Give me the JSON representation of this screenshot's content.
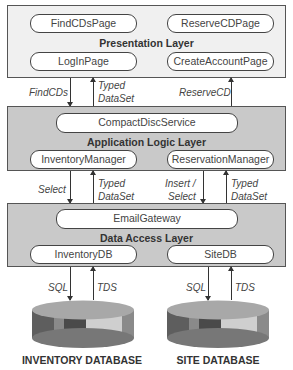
{
  "presentation_layer": {
    "label": "Presentation Layer",
    "nodes": [
      "FindCDsPage",
      "ReserveCDPage",
      "LogInPage",
      "CreateAccountPage"
    ]
  },
  "application_layer": {
    "label": "Application Logic Layer",
    "nodes": [
      "CompactDiscService",
      "InventoryManager",
      "ReservationManager"
    ]
  },
  "data_layer": {
    "label": "Data Access Layer",
    "nodes": [
      "EmailGateway",
      "InventoryDB",
      "SiteDB"
    ]
  },
  "connections": {
    "pres_to_app": {
      "left_down": "FindCDs",
      "left_up_1": "Typed",
      "left_up_2": "DataSet",
      "right_up": "ReserveCD"
    },
    "app_to_data": {
      "left_down": "Select",
      "left_up_1": "Typed",
      "left_up_2": "DataSet",
      "right_down_1": "Insert /",
      "right_down_2": "Select",
      "right_up_1": "Typed",
      "right_up_2": "DataSet"
    },
    "data_to_db": {
      "left_down": "SQL",
      "left_up": "TDS",
      "right_down": "SQL",
      "right_up": "TDS"
    }
  },
  "databases": [
    "INVENTORY DATABASE",
    "SITE DATABASE"
  ],
  "colors": {
    "presentation_bg": "#f0f0f0",
    "layer_bg": "#c9c9c9",
    "db_top": "#a8a8a8",
    "db_dark": "#555555",
    "db_mid": "#888888",
    "db_light": "#cfcfcf"
  }
}
